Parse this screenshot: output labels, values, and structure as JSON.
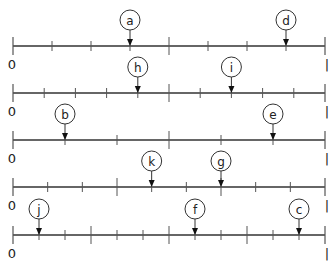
{
  "diagram": {
    "type": "number-lines",
    "start_label": "0",
    "end_label": "1",
    "colors": {
      "line": "#333333",
      "tick": "#555555",
      "circle": "#333333",
      "text": "#222222",
      "background": "#ffffff"
    },
    "lines": [
      {
        "id": "line-1",
        "divisions": 8,
        "major_ticks": [
          4
        ],
        "markers": [
          {
            "label": "a",
            "position": 3
          },
          {
            "label": "d",
            "position": 7
          }
        ]
      },
      {
        "id": "line-2",
        "divisions": 10,
        "major_ticks": [
          5
        ],
        "markers": [
          {
            "label": "h",
            "position": 4
          },
          {
            "label": "i",
            "position": 7
          }
        ]
      },
      {
        "id": "line-3",
        "divisions": 6,
        "major_ticks": [
          3
        ],
        "markers": [
          {
            "label": "b",
            "position": 1
          },
          {
            "label": "e",
            "position": 5
          }
        ]
      },
      {
        "id": "line-4",
        "divisions": 9,
        "major_ticks": [
          3,
          6
        ],
        "markers": [
          {
            "label": "k",
            "position": 4
          },
          {
            "label": "g",
            "position": 6
          }
        ]
      },
      {
        "id": "line-5",
        "divisions": 12,
        "major_ticks": [
          3,
          6,
          9
        ],
        "markers": [
          {
            "label": "j",
            "position": 1
          },
          {
            "label": "f",
            "position": 7
          },
          {
            "label": "c",
            "position": 11
          }
        ]
      }
    ]
  }
}
